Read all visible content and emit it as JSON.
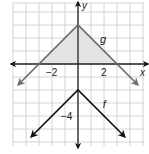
{
  "chart_data": {
    "type": "line",
    "title": "",
    "xlabel": "x",
    "ylabel": "y",
    "xlim": [
      -5,
      5
    ],
    "ylim": [
      -6,
      4
    ],
    "grid": true,
    "x_tick_labels": [
      {
        "value": -2,
        "label": "−2"
      },
      {
        "value": 2,
        "label": "2"
      }
    ],
    "y_tick_labels": [
      {
        "value": -4,
        "label": "−4"
      }
    ],
    "series": [
      {
        "name": "g",
        "label": "g",
        "description": "y = -|x| + 3",
        "color": "#6b6b6b",
        "points": [
          [
            -4.6,
            -1.6
          ],
          [
            0,
            3
          ],
          [
            4.6,
            -1.6
          ]
        ],
        "shaded_region": {
          "vertices": [
            [
              -3,
              0
            ],
            [
              0,
              3
            ],
            [
              3,
              0
            ]
          ],
          "color": "#e4e4e4"
        }
      },
      {
        "name": "f",
        "label": "f",
        "description": "y = -|x| - 2",
        "color": "#111111",
        "points": [
          [
            -3.6,
            -5.6
          ],
          [
            0,
            -2
          ],
          [
            3.6,
            -5.6
          ]
        ]
      }
    ]
  }
}
